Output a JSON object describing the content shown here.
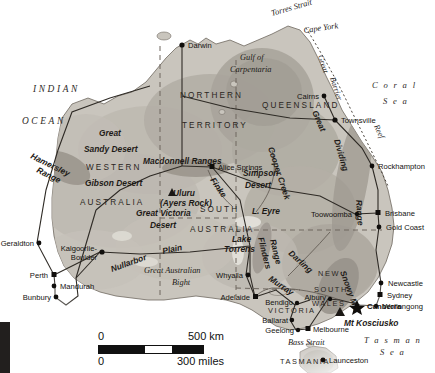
{
  "article": {
    "lines": [
      "o two islands.",
      "volcanoes and",
      "has mountains"
    ]
  },
  "map": {
    "title": "Australia",
    "colors": {
      "land_low": "#c9c5bd",
      "land_mid": "#b4afa6",
      "land_high": "#9d9890",
      "water": "#ffffff",
      "border_line": "#3a342e",
      "road_line": "#2e2a25",
      "state_dash": "#6e675f",
      "label": "#14120f"
    },
    "oceans": [
      {
        "name": "INDIAN",
        "line2": "OCEAN"
      }
    ],
    "ocean_labels": [
      {
        "text": "INDIAN",
        "x": 33,
        "y": 92
      },
      {
        "text": "OCEAN",
        "x": 22,
        "y": 124
      }
    ],
    "sea_labels": [
      {
        "text": "C o r a l",
        "x": 372,
        "y": 88
      },
      {
        "text": "S e a",
        "x": 383,
        "y": 104
      },
      {
        "text": "T a s m a n",
        "x": 368,
        "y": 343
      },
      {
        "text": "S e a",
        "x": 382,
        "y": 355
      }
    ],
    "states": [
      {
        "text": "NORTHERN",
        "x": 180,
        "y": 98
      },
      {
        "text": "TERRITORY",
        "x": 182,
        "y": 128
      },
      {
        "text": "WESTERN",
        "x": 86,
        "y": 170
      },
      {
        "text": "AUSTRALIA",
        "x": 80,
        "y": 205
      },
      {
        "text": "QUEENSLAND",
        "x": 262,
        "y": 108
      },
      {
        "text": "SOUTH",
        "x": 200,
        "y": 212
      },
      {
        "text": "AUSTRALIA",
        "x": 196,
        "y": 232
      },
      {
        "text": "NEW",
        "x": 318,
        "y": 276
      },
      {
        "text": "SOUTH",
        "x": 314,
        "y": 292
      },
      {
        "text": "WALES",
        "x": 312,
        "y": 306
      },
      {
        "text": "VICTORIA",
        "x": 272,
        "y": 312
      },
      {
        "text": "TASMANIA",
        "x": 283,
        "y": 363
      }
    ],
    "cities": [
      {
        "name": "Darwin",
        "x": 182,
        "y": 45,
        "anchor": "start",
        "dx": 6,
        "dy": 3,
        "marker": "dot",
        "capital": false
      },
      {
        "name": "Cairns",
        "x": 324,
        "y": 96,
        "anchor": "end",
        "dx": -5,
        "dy": 3,
        "marker": "dot",
        "capital": false
      },
      {
        "name": "Townsville",
        "x": 335,
        "y": 120,
        "anchor": "start",
        "dx": 6,
        "dy": 3,
        "marker": "dot",
        "capital": false
      },
      {
        "name": "Rockhampton",
        "x": 372,
        "y": 166,
        "anchor": "start",
        "dx": 6,
        "dy": 3,
        "marker": "dot",
        "capital": false
      },
      {
        "name": "Brisbane",
        "x": 378,
        "y": 213,
        "anchor": "start",
        "dx": 7,
        "dy": 3,
        "marker": "square",
        "capital": false
      },
      {
        "name": "Gold Coast",
        "x": 379,
        "y": 227,
        "anchor": "start",
        "dx": 7,
        "dy": 3,
        "marker": "dot",
        "capital": false
      },
      {
        "name": "Toowoomba",
        "x": 355,
        "y": 214,
        "anchor": "end",
        "dx": -5,
        "dy": 3,
        "marker": "dot",
        "capital": false
      },
      {
        "name": "Newcastle",
        "x": 381,
        "y": 283,
        "anchor": "start",
        "dx": 7,
        "dy": 3,
        "marker": "dot",
        "capital": false
      },
      {
        "name": "Sydney",
        "x": 380,
        "y": 295,
        "anchor": "start",
        "dx": 7,
        "dy": 3,
        "marker": "square",
        "capital": false
      },
      {
        "name": "Wollongong",
        "x": 376,
        "y": 306,
        "anchor": "start",
        "dx": 7,
        "dy": 3,
        "marker": "dot",
        "capital": false
      },
      {
        "name": "Canberra",
        "x": 360,
        "y": 305,
        "anchor": "start",
        "dx": 7,
        "dy": 3,
        "marker": "star",
        "capital": true
      },
      {
        "name": "Albury",
        "x": 328,
        "y": 299,
        "anchor": "end",
        "dx": -5,
        "dy": 2,
        "marker": "dot",
        "capital": false
      },
      {
        "name": "Melbourne",
        "x": 308,
        "y": 329,
        "anchor": "start",
        "dx": 6,
        "dy": 3,
        "marker": "square",
        "capital": false
      },
      {
        "name": "Geelong",
        "x": 296,
        "y": 330,
        "anchor": "end",
        "dx": -5,
        "dy": 3,
        "marker": "dot",
        "capital": false
      },
      {
        "name": "Ballarat",
        "x": 290,
        "y": 320,
        "anchor": "end",
        "dx": -5,
        "dy": 3,
        "marker": "dot",
        "capital": false
      },
      {
        "name": "Bendigo",
        "x": 295,
        "y": 305,
        "anchor": "end",
        "dx": -5,
        "dy": 2,
        "marker": "dot",
        "capital": false
      },
      {
        "name": "Launceston",
        "x": 323,
        "y": 360,
        "anchor": "start",
        "dx": 6,
        "dy": 3,
        "marker": "dot",
        "capital": false
      },
      {
        "name": "Adelaide",
        "x": 255,
        "y": 297,
        "anchor": "end",
        "dx": -5,
        "dy": 3,
        "marker": "square",
        "capital": false
      },
      {
        "name": "Whyalla",
        "x": 246,
        "y": 275,
        "anchor": "end",
        "dx": -5,
        "dy": 3,
        "marker": "dot",
        "capital": false
      },
      {
        "name": "Alice Springs",
        "x": 212,
        "y": 167,
        "anchor": "start",
        "dx": 6,
        "dy": 3,
        "marker": "square",
        "capital": false
      },
      {
        "name": "Kalgoorlie-",
        "x": 100,
        "y": 252,
        "anchor": "end",
        "dx": -5,
        "dy": -1,
        "marker": "dot",
        "capital": false
      },
      {
        "name": "Boulder",
        "x": 100,
        "y": 252,
        "anchor": "end",
        "dx": -5,
        "dy": 8,
        "marker": "none",
        "capital": false
      },
      {
        "name": "Geraldton",
        "x": 37,
        "y": 243,
        "anchor": "end",
        "dx": -5,
        "dy": 3,
        "marker": "dot",
        "capital": false
      },
      {
        "name": "Perth",
        "x": 54,
        "y": 275,
        "anchor": "end",
        "dx": -5,
        "dy": 3,
        "marker": "square",
        "capital": false
      },
      {
        "name": "Mandurah",
        "x": 55,
        "y": 286,
        "anchor": "start",
        "dx": 5,
        "dy": 3,
        "marker": "dot",
        "capital": false
      },
      {
        "name": "Bunbury",
        "x": 55,
        "y": 297,
        "anchor": "end",
        "dx": -5,
        "dy": 3,
        "marker": "dot",
        "capital": false
      }
    ],
    "physical": [
      {
        "text": "Torres Strait",
        "x": 272,
        "y": 16,
        "rot": -16,
        "style": "phys"
      },
      {
        "text": "Cape York",
        "x": 304,
        "y": 33,
        "rot": -8,
        "style": "phys"
      },
      {
        "text": "Gulf of",
        "x": 240,
        "y": 60,
        "rot": 0,
        "style": "phys"
      },
      {
        "text": "Carpentaria",
        "x": 230,
        "y": 72,
        "rot": 0,
        "style": "phys"
      },
      {
        "text": "Great",
        "x": 99,
        "y": 136,
        "rot": 0,
        "style": "physb"
      },
      {
        "text": "Sandy Desert",
        "x": 84,
        "y": 152,
        "rot": 0,
        "style": "physb"
      },
      {
        "text": "Gibson Desert",
        "x": 85,
        "y": 186,
        "rot": 0,
        "style": "physb"
      },
      {
        "text": "Great Victoria",
        "x": 136,
        "y": 216,
        "rot": 0,
        "style": "physb"
      },
      {
        "text": "Desert",
        "x": 150,
        "y": 228,
        "rot": 0,
        "style": "physb"
      },
      {
        "text": "Hamersley",
        "x": 30,
        "y": 158,
        "rot": 26,
        "style": "physb"
      },
      {
        "text": "Range",
        "x": 40,
        "y": 172,
        "rot": 26,
        "style": "physb"
      },
      {
        "text": "Macdonnell Ranges",
        "x": 143,
        "y": 164,
        "rot": 0,
        "style": "physb"
      },
      {
        "text": "Uluru",
        "x": 173,
        "y": 196,
        "rot": 0,
        "style": "physb"
      },
      {
        "text": "(Ayers Rock)",
        "x": 162,
        "y": 206,
        "rot": 0,
        "style": "physb"
      },
      {
        "text": "Simpson",
        "x": 243,
        "y": 176,
        "rot": 0,
        "style": "physb"
      },
      {
        "text": "Desert",
        "x": 245,
        "y": 188,
        "rot": 0,
        "style": "physb"
      },
      {
        "text": "Finke",
        "x": 214,
        "y": 185,
        "rot": 56,
        "style": "physb"
      },
      {
        "text": "L. Eyre",
        "x": 252,
        "y": 214,
        "rot": 0,
        "style": "physb"
      },
      {
        "text": "Lake",
        "x": 232,
        "y": 242,
        "rot": 0,
        "style": "physb"
      },
      {
        "text": "Torrens",
        "x": 226,
        "y": 252,
        "rot": 0,
        "style": "physb"
      },
      {
        "text": "Flinders",
        "x": 259,
        "y": 243,
        "rot": 74,
        "style": "physb"
      },
      {
        "text": "Range",
        "x": 270,
        "y": 246,
        "rot": 74,
        "style": "physb"
      },
      {
        "text": "Cooper Creek",
        "x": 278,
        "y": 160,
        "rot": 72,
        "style": "physb"
      },
      {
        "text": "Darling",
        "x": 292,
        "y": 258,
        "rot": 42,
        "style": "physb"
      },
      {
        "text": "Murray",
        "x": 275,
        "y": 281,
        "rot": 34,
        "style": "physb"
      },
      {
        "text": "Nullarbor",
        "x": 122,
        "y": 266,
        "rot": -20,
        "style": "physb"
      },
      {
        "text": "Plain",
        "x": 166,
        "y": 254,
        "rot": -12,
        "style": "physb"
      },
      {
        "text": "Great Australian",
        "x": 148,
        "y": 272,
        "rot": 0,
        "style": "phys"
      },
      {
        "text": "Bight",
        "x": 172,
        "y": 284,
        "rot": 0,
        "style": "phys"
      },
      {
        "text": "Great",
        "x": 322,
        "y": 105,
        "rot": 70,
        "style": "reef"
      },
      {
        "text": "Barrier",
        "x": 334,
        "y": 82,
        "rot": 70,
        "style": "reef"
      },
      {
        "text": "Reef",
        "x": 386,
        "y": 128,
        "rot": 66,
        "style": "reef"
      },
      {
        "text": "Great",
        "x": 320,
        "y": 108,
        "rot": 64,
        "style": "physb"
      },
      {
        "text": "Dividing",
        "x": 352,
        "y": 135,
        "rot": 74,
        "style": "physb"
      },
      {
        "text": "Range",
        "x": 370,
        "y": 210,
        "rot": 86,
        "style": "physb"
      },
      {
        "text": "Snowy Mts",
        "x": 344,
        "y": 286,
        "rot": 70,
        "style": "physb"
      },
      {
        "text": "Mt Kosciusko",
        "x": 344,
        "y": 325,
        "rot": 0,
        "style": "physb"
      },
      {
        "text": "Bass Strait",
        "x": 288,
        "y": 344,
        "rot": 0,
        "style": "phys"
      }
    ],
    "scale": {
      "km_zero": "0",
      "km_value": "500 km",
      "miles_zero": "0",
      "miles_value": "300 miles"
    }
  }
}
